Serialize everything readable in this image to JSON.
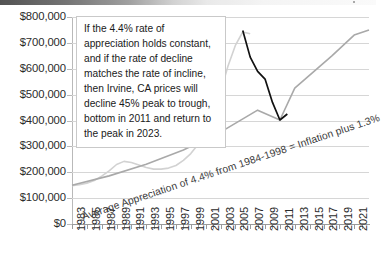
{
  "chart_data": {
    "type": "line",
    "title": "",
    "xlabel": "",
    "ylabel": "",
    "ylim": [
      0,
      800000
    ],
    "xlim": [
      1983,
      2023
    ],
    "grid": true,
    "legend": "none",
    "y_ticks": [
      "$0",
      "$100,000",
      "$200,000",
      "$300,000",
      "$400,000",
      "$500,000",
      "$600,000",
      "$700,000",
      "$800,000"
    ],
    "y_tick_values": [
      0,
      100000,
      200000,
      300000,
      400000,
      500000,
      600000,
      700000,
      800000
    ],
    "x_ticks": [
      "1983",
      "1985",
      "1987",
      "1989",
      "1991",
      "1993",
      "1995",
      "1997",
      "1999",
      "2001",
      "2003",
      "2005",
      "2007",
      "2009",
      "2011",
      "2013",
      "2015",
      "2017",
      "2019",
      "2021"
    ],
    "x_tick_values": [
      1983,
      1985,
      1987,
      1989,
      1991,
      1993,
      1995,
      1997,
      1999,
      2001,
      2003,
      2005,
      2007,
      2009,
      2011,
      2013,
      2015,
      2017,
      2019,
      2021
    ],
    "annotations": [
      {
        "name": "forecast-note",
        "text": "If the 4.4% rate of appreciation holds constant, and if the rate of decline matches the rate of incline, then Irvine, CA prices will decline 45% peak to trough, bottom in 2011 and return to the peak in 2023."
      },
      {
        "name": "trendline-label",
        "text": "Average Appreciation of 4.4% from 1984-1998 = Inflation plus 1.3%"
      }
    ],
    "series": [
      {
        "name": "Actual Irvine CA home prices",
        "color": "#d2d2d2",
        "x": [
          1983,
          1984,
          1985,
          1986,
          1987,
          1988,
          1989,
          1990,
          1991,
          1992,
          1993,
          1994,
          1995,
          1996,
          1997,
          1998,
          1999,
          2000,
          2001,
          2002,
          2003,
          2004,
          2005,
          2006,
          2007
        ],
        "values": [
          148000,
          152000,
          158000,
          168000,
          185000,
          205000,
          230000,
          242000,
          238000,
          228000,
          218000,
          212000,
          212000,
          216000,
          226000,
          246000,
          272000,
          308000,
          352000,
          420000,
          510000,
          610000,
          690000,
          742000,
          735000
        ]
      },
      {
        "name": "4.4% trend line",
        "color": "#a9a9a9",
        "x": [
          1983,
          1988,
          1993,
          1998,
          2003,
          2008,
          2011,
          2013,
          2018,
          2021,
          2023
        ],
        "values": [
          150000,
          186000,
          231000,
          286000,
          355000,
          440000,
          402000,
          525000,
          650000,
          730000,
          750000
        ]
      },
      {
        "name": "Projected decline and recovery",
        "color": "#111111",
        "x": [
          2006,
          2007,
          2008,
          2009,
          2010,
          2011,
          2012
        ],
        "values": [
          748000,
          645000,
          590000,
          560000,
          470000,
          402000,
          425000
        ]
      }
    ]
  },
  "chrome": {
    "strip_label": ""
  }
}
